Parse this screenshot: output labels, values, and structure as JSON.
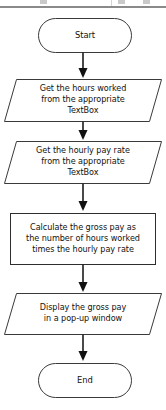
{
  "diagram": {
    "background_color": "#ffffff",
    "stroke_color": "#3a3a3a",
    "arrow_color": "#111111",
    "text_color": "#111111"
  },
  "top_edge": {
    "line_color": "#8a8a8a"
  },
  "nodes": {
    "start": {
      "label": "Start",
      "shape": "terminator"
    },
    "input_hours": {
      "label": "Get the hours worked\nfrom  the appropriate\nTextBox",
      "shape": "parallelogram"
    },
    "input_rate": {
      "label": "Get the hourly pay rate\nfrom  the appropriate\nTextBox",
      "shape": "parallelogram"
    },
    "process_gross_pay": {
      "label": "Calculate the gross pay as\nthe number of hours worked\ntimes the hourly pay rate",
      "shape": "process"
    },
    "output_display": {
      "label": "Display the gross pay\nin a pop-up window",
      "shape": "parallelogram"
    },
    "end": {
      "label": "End",
      "shape": "terminator"
    }
  }
}
